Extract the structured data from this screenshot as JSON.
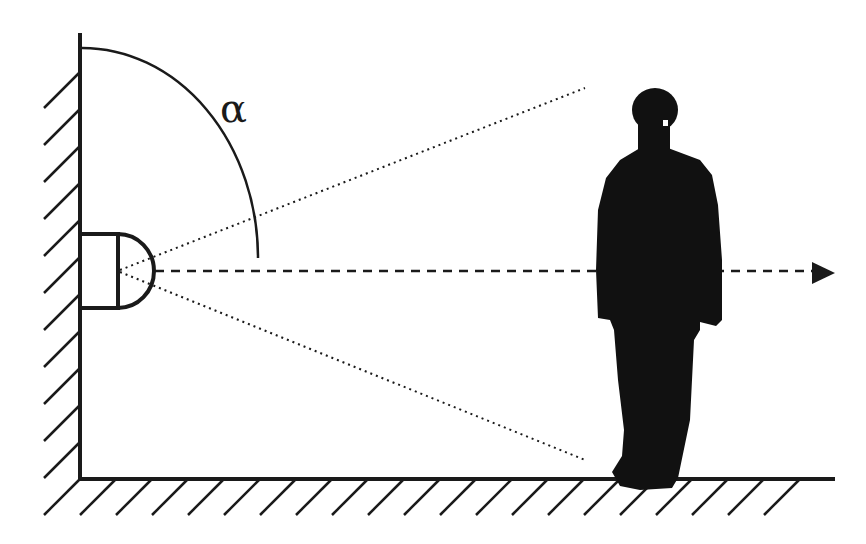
{
  "diagram": {
    "angle_label": "α",
    "colors": {
      "stroke": "#1a1a1a",
      "figure": "#111111",
      "background": "#ffffff"
    },
    "elements": {
      "wall": "hatched-vertical-wall",
      "floor": "hatched-horizontal-floor",
      "sensor": "dome-sensor-on-wall",
      "angle_arc": "detection-angle-arc",
      "field_of_view": [
        "upper-dotted-boundary",
        "lower-dotted-boundary"
      ],
      "axis": "dashed-center-axis-with-arrow",
      "person": "standing-person-silhouette"
    }
  }
}
